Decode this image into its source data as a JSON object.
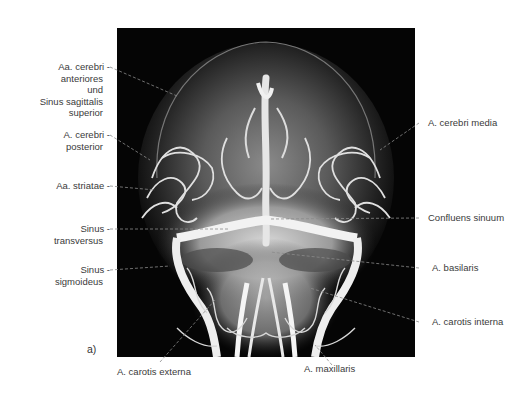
{
  "figure": {
    "panel_letter": "a)",
    "image_description": "Angiogram of head, frontal view (arteries and venous sinuses)"
  },
  "labels_left": [
    {
      "id": "aa-cerebri-anteriores",
      "lines": [
        "Aa. cerebri -",
        "anteriores",
        "und",
        "Sinus sagittalis",
        "superior"
      ]
    },
    {
      "id": "a-cerebri-posterior",
      "lines": [
        "A. cerebri -",
        "posterior"
      ]
    },
    {
      "id": "aa-striatae",
      "lines": [
        "Aa. striatae -"
      ]
    },
    {
      "id": "sinus-transversus",
      "lines": [
        "Sinus -",
        "transversus"
      ]
    },
    {
      "id": "sinus-sigmoideus",
      "lines": [
        "Sinus -",
        "sigmoideus"
      ]
    }
  ],
  "labels_right": [
    {
      "id": "a-cerebri-media",
      "text": "A. cerebri media"
    },
    {
      "id": "confluens-sinuum",
      "text": "Confluens sinuum"
    },
    {
      "id": "a-basilaris",
      "text": "A. basilaris"
    },
    {
      "id": "a-carotis-interna",
      "text": "A. carotis interna"
    }
  ],
  "labels_bottom": [
    {
      "id": "a-carotis-externa",
      "text": "A. carotis externa"
    },
    {
      "id": "a-maxillaris",
      "text": "A. maxillaris"
    }
  ],
  "colors": {
    "background": "#ffffff",
    "image_bg": "#050505",
    "label_text": "#3a3a3a",
    "leader_line": "#8a8a8a"
  }
}
